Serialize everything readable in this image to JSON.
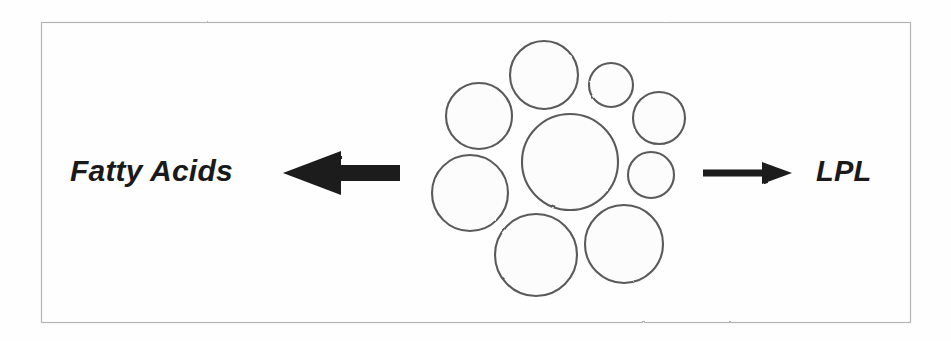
{
  "figure": {
    "background_color": "#fefefe",
    "border_color": "#b4b4b4",
    "ink_color": "#1a1a1a",
    "circle_stroke_color": "#5a5a5a",
    "circle_fill_color": "#fcfcfc"
  },
  "frame": {
    "x": 41,
    "y": 22,
    "width": 869,
    "height": 300
  },
  "labels": {
    "left": "Fatty Acids",
    "right": "LPL"
  },
  "arrows": {
    "left": {
      "name": "left-arrow",
      "direction": "left",
      "tip_x": 283,
      "tail_x": 400,
      "center_y": 173,
      "shaft_thickness": 16,
      "head_length": 58,
      "head_half_height": 22
    },
    "right": {
      "name": "right-arrow",
      "direction": "right",
      "tip_x": 792,
      "tail_x": 703,
      "center_y": 173,
      "shaft_thickness": 7,
      "head_length": 30,
      "head_half_height": 11
    }
  },
  "cluster": {
    "name": "lipid-droplet-cluster",
    "circles": [
      {
        "id": "core",
        "label": "central-droplet",
        "cx": 570,
        "cy": 162,
        "r": 48
      },
      {
        "id": "top",
        "label": "droplet-top",
        "cx": 544,
        "cy": 75,
        "r": 34
      },
      {
        "id": "top-right",
        "label": "droplet-top-right",
        "cx": 611,
        "cy": 85,
        "r": 22
      },
      {
        "id": "right-upper",
        "label": "droplet-right-upper",
        "cx": 659,
        "cy": 118,
        "r": 26
      },
      {
        "id": "right-lower",
        "label": "droplet-right-lower",
        "cx": 651,
        "cy": 175,
        "r": 23
      },
      {
        "id": "bottom-right",
        "label": "droplet-bottom-right",
        "cx": 624,
        "cy": 244,
        "r": 39
      },
      {
        "id": "bottom-left",
        "label": "droplet-bottom-left",
        "cx": 536,
        "cy": 255,
        "r": 41
      },
      {
        "id": "left-lower",
        "label": "droplet-left-lower",
        "cx": 470,
        "cy": 193,
        "r": 38
      },
      {
        "id": "left-upper",
        "label": "droplet-left-upper",
        "cx": 479,
        "cy": 116,
        "r": 33
      }
    ]
  }
}
